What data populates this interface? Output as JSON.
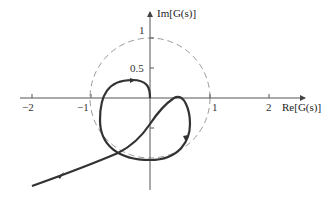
{
  "diagram": {
    "type": "nyquist-plot",
    "axes": {
      "x_label": "Re[G(s)]",
      "y_label": "Im[G(s)]",
      "x_ticks": [
        {
          "value": -2,
          "label": "−2"
        },
        {
          "value": -1,
          "label": "−1"
        },
        {
          "value": 1,
          "label": "1"
        },
        {
          "value": 2,
          "label": "2"
        }
      ],
      "y_ticks": [
        {
          "value": 1,
          "label": "1"
        },
        {
          "value": 0.5,
          "label": "0.5"
        },
        {
          "value": -0.5,
          "label": ""
        }
      ]
    },
    "unit_circle": {
      "radius": 1,
      "style": "dashed",
      "color": "#999999"
    },
    "curve": {
      "color": "#333333",
      "direction_arrows": 3
    }
  }
}
